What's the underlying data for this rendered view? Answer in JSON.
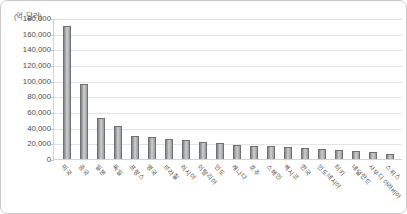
{
  "chart_data": {
    "type": "bar",
    "title": "",
    "subtitle": "",
    "xlabel": "",
    "ylabel": "(억 달러)",
    "unit_caption": "(억 달러)",
    "ylim": [
      0,
      180000
    ],
    "ytick_step": 20000,
    "grid": true,
    "legend": false,
    "legend_position": "none",
    "ytick_labels": [
      "180,000",
      "160,000",
      "140,000",
      "120,000",
      "100,000",
      "80,000",
      "60,000",
      "40,000",
      "20,000",
      "0"
    ],
    "ytick_values": [
      180000,
      160000,
      140000,
      120000,
      100000,
      80000,
      60000,
      40000,
      20000,
      0
    ],
    "categories": [
      "미국",
      "중국",
      "일본",
      "독일",
      "프랑스",
      "영국",
      "브라질",
      "러시아",
      "이탈리아",
      "인도",
      "캐나다",
      "호주",
      "스페인",
      "멕시코",
      "한국",
      "인도네시아",
      "터키",
      "네덜란드",
      "사우디 아라비아",
      "스위스"
    ],
    "values": [
      170000,
      96000,
      52000,
      42000,
      30000,
      28000,
      26000,
      24000,
      22000,
      20000,
      18000,
      17000,
      16000,
      15000,
      14000,
      13000,
      11000,
      10000,
      9000,
      7000
    ]
  }
}
